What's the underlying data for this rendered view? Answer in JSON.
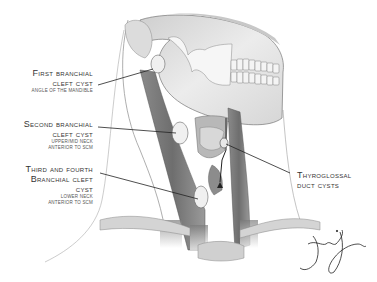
{
  "figure": {
    "labels": [
      {
        "id": "first-branchial",
        "title_lines": [
          "First branchial",
          "cleft cyst"
        ],
        "sub_lines": [
          "Angle of the mandible"
        ]
      },
      {
        "id": "second-branchial",
        "title_lines": [
          "Second branchial",
          "cleft cyst"
        ],
        "sub_lines": [
          "Upper/mid neck",
          "anterior to SCM"
        ]
      },
      {
        "id": "third-fourth-branchial",
        "title_lines": [
          "Third and fourth",
          "Branchial cleft",
          "cyst"
        ],
        "sub_lines": [
          "Lower neck",
          "anterior to SCM"
        ]
      },
      {
        "id": "thyroglossal",
        "title_lines": [
          "Thyroglossal",
          "duct cysts"
        ],
        "sub_lines": []
      }
    ],
    "signature": "artist-signature",
    "colors": {
      "ink": "#333333",
      "muscle": "#7a7a7a",
      "bone": "#e2e2e2",
      "cyst": "#f0f0f0",
      "background": "#ffffff"
    }
  }
}
